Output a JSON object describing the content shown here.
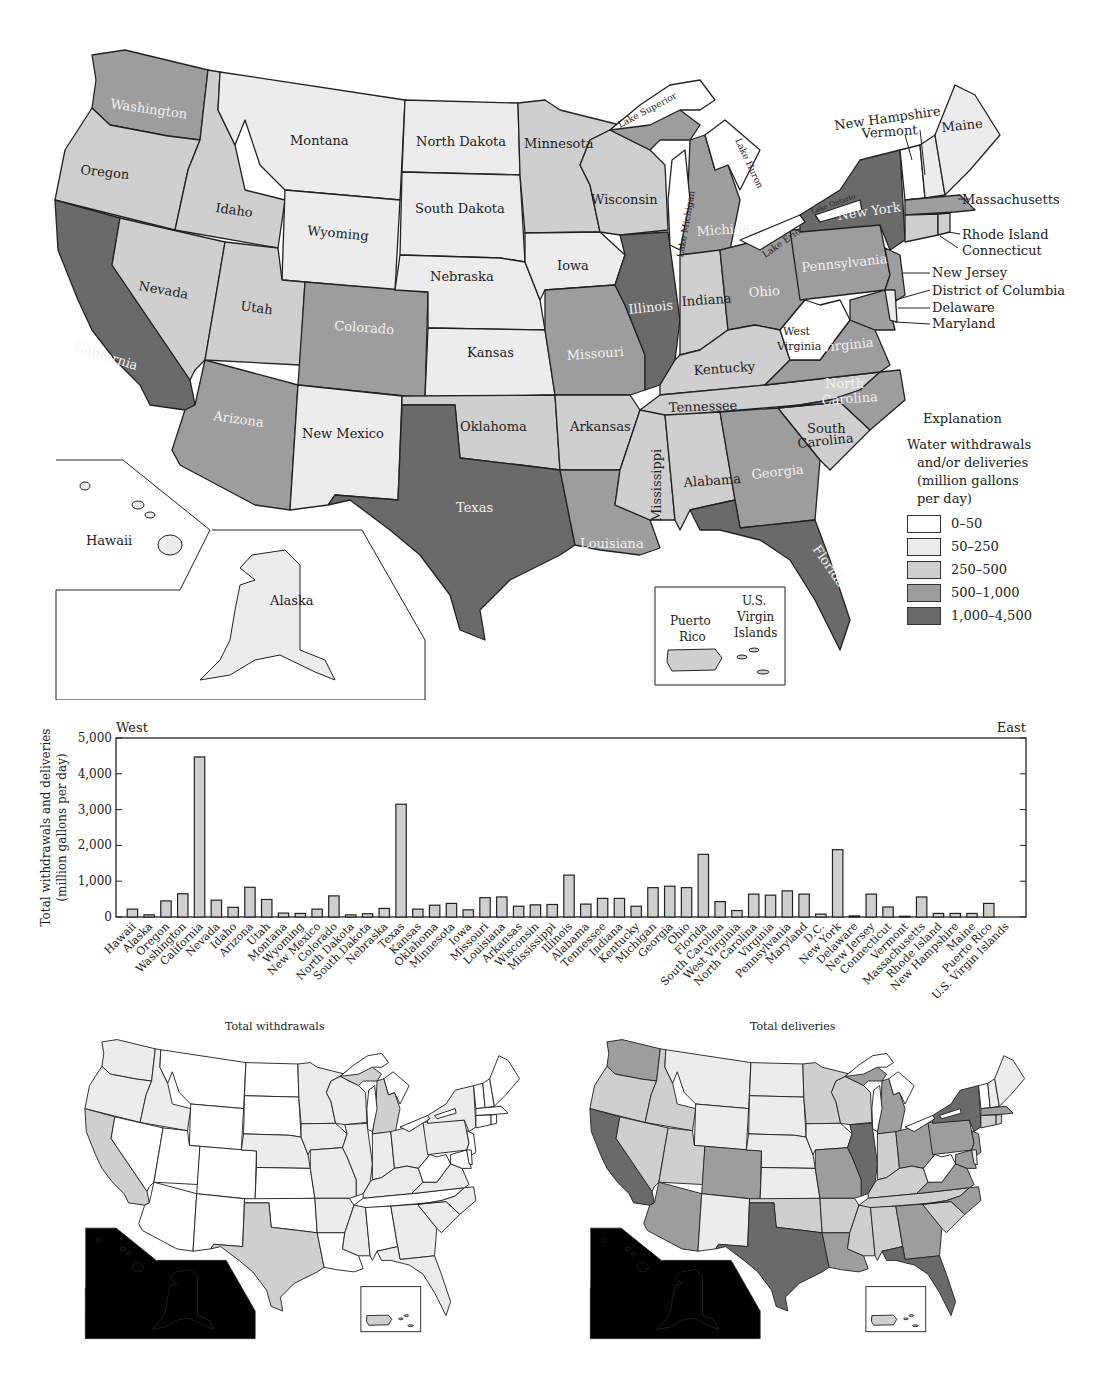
{
  "main_map": {
    "state_labels": {
      "washington": "Washington",
      "oregon": "Oregon",
      "california": "California",
      "idaho": "Idaho",
      "nevada": "Nevada",
      "montana": "Montana",
      "wyoming": "Wyoming",
      "utah": "Utah",
      "colorado": "Colorado",
      "arizona": "Arizona",
      "new_mexico": "New Mexico",
      "north_dakota": "North Dakota",
      "south_dakota": "South Dakota",
      "nebraska": "Nebraska",
      "kansas": "Kansas",
      "oklahoma": "Oklahoma",
      "texas": "Texas",
      "minnesota": "Minnesota",
      "iowa": "Iowa",
      "missouri": "Missouri",
      "arkansas": "Arkansas",
      "louisiana": "Louisiana",
      "wisconsin": "Wisconsin",
      "illinois": "Illinois",
      "michigan": "Michigan",
      "indiana": "Indiana",
      "ohio": "Ohio",
      "kentucky": "Kentucky",
      "tennessee": "Tennessee",
      "mississippi": "Mississippi",
      "alabama": "Alabama",
      "georgia": "Georgia",
      "florida": "Florida",
      "south_carolina_1": "South",
      "south_carolina_2": "Carolina",
      "north_carolina_1": "North",
      "north_carolina_2": "Carolina",
      "virginia": "Virginia",
      "west_virginia_1": "West",
      "west_virginia_2": "Virginia",
      "pennsylvania": "Pennsylvania",
      "new_york": "New York",
      "maine": "Maine",
      "hawaii": "Hawaii",
      "alaska": "Alaska"
    },
    "lake_labels": {
      "superior": "Lake Superior",
      "michigan": "Lake Michigan",
      "huron": "Lake Huron",
      "erie": "Lake Erie",
      "ontario": "Lake Ontario"
    },
    "leader_labels": {
      "new_hampshire": "New Hampshire",
      "vermont": "Vermont",
      "massachusetts": "Massachusetts",
      "rhode_island": "Rhode Island",
      "connecticut": "Connecticut",
      "new_jersey": "New Jersey",
      "dc": "District of Columbia",
      "delaware": "Delaware",
      "maryland": "Maryland"
    },
    "territories_inset": {
      "puerto_rico_1": "Puerto",
      "puerto_rico_2": "Rico",
      "usvi_1": "U.S.",
      "usvi_2": "Virgin",
      "usvi_3": "Islands"
    },
    "colors": {
      "c0": "#ffffff",
      "c1": "#ececec",
      "c2": "#cfcfcf",
      "c3": "#9d9d9d",
      "c4": "#6a6a6a"
    }
  },
  "legend": {
    "title": "Explanation",
    "subtitle_1": "Water withdrawals",
    "subtitle_2": "and/or deliveries",
    "subtitle_3": "(million gallons",
    "subtitle_4": "per day)",
    "items": [
      {
        "label": "0–50",
        "color": "#ffffff"
      },
      {
        "label": "50–250",
        "color": "#ececec"
      },
      {
        "label": "250–500",
        "color": "#cfcfcf"
      },
      {
        "label": "500–1,000",
        "color": "#9d9d9d"
      },
      {
        "label": "1,000–4,500",
        "color": "#6a6a6a"
      }
    ]
  },
  "bar_chart": {
    "left_label": "West",
    "right_label": "East",
    "ylabel_1": "Total withdrawals and deliveries",
    "ylabel_2": "(million gallons per day)",
    "yticks": [
      "0",
      "1,000",
      "2,000",
      "3,000",
      "4,000",
      "5,000"
    ]
  },
  "chart_data": {
    "type": "bar",
    "title": "",
    "xlabel": "",
    "ylabel": "Total withdrawals and deliveries (million gallons per day)",
    "ylim": [
      0,
      5000
    ],
    "grid": false,
    "annotations": [
      "West",
      "East"
    ],
    "categories": [
      "Hawaii",
      "Alaska",
      "Oregon",
      "Washington",
      "California",
      "Nevada",
      "Idaho",
      "Arizona",
      "Utah",
      "Montana",
      "Wyoming",
      "New Mexico",
      "Colorado",
      "North Dakota",
      "South Dakota",
      "Nebraska",
      "Texas",
      "Kansas",
      "Oklahoma",
      "Minnesota",
      "Iowa",
      "Missouri",
      "Louisiana",
      "Arkansas",
      "Wisconsin",
      "Mississippi",
      "Illinois",
      "Alabama",
      "Tennessee",
      "Indiana",
      "Kentucky",
      "Michigan",
      "Georgia",
      "Ohio",
      "Florida",
      "South Carolina",
      "West Virginia",
      "North Carolina",
      "Virginia",
      "Pennsylvania",
      "Maryland",
      "D.C.",
      "New York",
      "Delaware",
      "New Jersey",
      "Connecticut",
      "Vermont",
      "Massachusetts",
      "Rhode Island",
      "New Hampshire",
      "Maine",
      "Puerto Rico",
      "U.S. Virgin Islands"
    ],
    "values": [
      220,
      60,
      450,
      650,
      4470,
      470,
      270,
      830,
      490,
      110,
      100,
      220,
      590,
      60,
      90,
      240,
      3150,
      220,
      330,
      380,
      200,
      540,
      560,
      300,
      340,
      350,
      1170,
      360,
      520,
      520,
      300,
      820,
      860,
      820,
      1750,
      430,
      180,
      640,
      610,
      730,
      640,
      80,
      1880,
      30,
      640,
      280,
      20,
      560,
      100,
      100,
      100,
      380,
      0
    ]
  },
  "sub_maps": {
    "withdrawals_title": "Total withdrawals",
    "deliveries_title": "Total deliveries"
  }
}
